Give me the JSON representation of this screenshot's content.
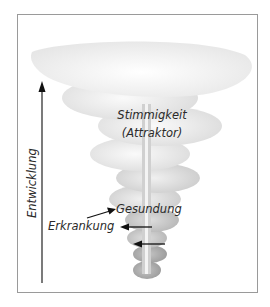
{
  "diagram": {
    "labels": {
      "attractor_line1": "Stimmigkeit",
      "attractor_line2": "(Attraktor)",
      "axis": "Entwicklung",
      "health": "Gesundung",
      "illness": "Erkrankung"
    },
    "colors": {
      "frame": "#9a9a9a",
      "spiral_light": "#f2f2f2",
      "spiral_dark": "#9e9e9e",
      "arrow": "#111111",
      "text": "#2a2a2a"
    }
  }
}
